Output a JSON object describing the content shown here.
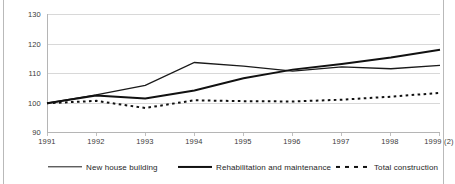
{
  "chart_data": {
    "type": "line",
    "title": "",
    "subtitle": "",
    "xlabel": "",
    "ylabel": "",
    "categories": [
      "1991",
      "1992",
      "1993",
      "1994",
      "1995",
      "1996",
      "1997",
      "1998",
      "1999 (2)"
    ],
    "ylim": [
      90,
      130
    ],
    "yticks": [
      90,
      100,
      110,
      120,
      130
    ],
    "grid": true,
    "legend_position": "bottom",
    "series": [
      {
        "name": "New house building",
        "style": "solid-thin",
        "color": "#1a1a1a",
        "values": [
          100.0,
          102.8,
          106.0,
          113.7,
          112.5,
          110.8,
          112.2,
          111.6,
          112.7
        ]
      },
      {
        "name": "Rehabilitation and maintenance",
        "style": "solid-thick",
        "color": "#111111",
        "values": [
          100.0,
          102.6,
          101.6,
          104.3,
          108.4,
          111.3,
          113.2,
          115.4,
          118.0
        ]
      },
      {
        "name": "Total construction",
        "style": "dotted",
        "color": "#111111",
        "values": [
          100.0,
          100.8,
          98.4,
          101.0,
          100.7,
          100.6,
          101.2,
          102.2,
          103.5
        ]
      }
    ]
  },
  "axis": {
    "y_tick_labels": [
      "130",
      "120",
      "110",
      "100",
      "90"
    ],
    "x_tick_labels": [
      "1991",
      "1992",
      "1993",
      "1994",
      "1995",
      "1996",
      "1997",
      "1998",
      "1999 (2)"
    ]
  },
  "legend": {
    "items": [
      {
        "label": "New house building",
        "marker": "solid-thin-line-icon"
      },
      {
        "label": "Rehabilitation and maintenance",
        "marker": "solid-thick-line-icon"
      },
      {
        "label": "Total construction",
        "marker": "dotted-line-icon"
      }
    ]
  },
  "colors": {
    "grid": "#d8d8d8",
    "axis": "#b5b5b5",
    "text": "#3a3a3a",
    "series": "#111111",
    "background": "#ffffff"
  }
}
